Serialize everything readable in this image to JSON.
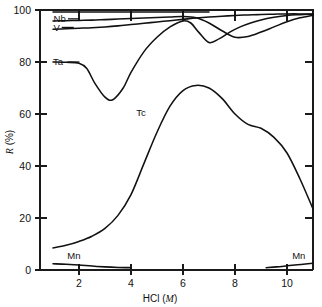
{
  "chart_data": {
    "type": "line",
    "title": "",
    "xlabel": "HCl (M)",
    "ylabel": "R (%)",
    "xlim": [
      0.5,
      11.0
    ],
    "ylim": [
      0,
      100
    ],
    "xticks": [
      2,
      4,
      6,
      8,
      10
    ],
    "xticklabels": [
      "2",
      "4",
      "6",
      "8",
      "10"
    ],
    "yticks": [
      0,
      20,
      40,
      60,
      80,
      100
    ],
    "yticklabels": [
      "0",
      "20",
      "40",
      "60",
      "80",
      "100"
    ],
    "grid": false,
    "legend": "inline-labels",
    "series": [
      {
        "name": "Nb",
        "label": "Nb",
        "x": [
          1.0,
          1.5,
          2.0,
          2.5,
          3.0,
          3.5,
          4.0,
          4.5,
          5.0,
          5.5,
          6.0,
          6.5,
          7.0,
          7.5,
          8.0,
          8.5,
          9.0,
          9.5,
          10.0,
          10.5,
          11.0
        ],
        "values": [
          95.8,
          95.9,
          96.0,
          96.1,
          96.3,
          96.5,
          96.7,
          96.9,
          97.1,
          97.3,
          97.5,
          97.0,
          95.0,
          92.0,
          89.5,
          89.8,
          91.5,
          93.5,
          95.5,
          97.0,
          98.0
        ]
      },
      {
        "name": "V",
        "label": "V",
        "x": [
          1.0,
          1.5,
          2.0,
          2.5,
          3.0,
          3.5,
          4.0,
          4.5,
          5.0,
          5.5,
          6.0,
          6.5,
          7.0,
          7.5,
          8.0,
          8.5,
          9.0,
          9.5,
          10.0,
          10.5,
          11.0
        ],
        "values": [
          92.6,
          92.8,
          93.0,
          93.2,
          93.5,
          93.9,
          94.4,
          94.9,
          95.4,
          95.9,
          96.4,
          96.9,
          97.3,
          97.6,
          97.9,
          98.1,
          98.3,
          98.4,
          98.5,
          98.5,
          98.5
        ]
      },
      {
        "name": "Ta",
        "label": "Ta",
        "x": [
          1.0,
          1.5,
          2.0,
          2.3,
          2.6,
          3.0,
          3.3,
          3.7,
          4.0,
          4.5,
          5.0,
          5.5,
          6.0,
          6.3,
          6.6,
          7.0,
          7.4,
          7.8,
          8.2,
          8.6,
          9.0,
          9.5,
          10.0,
          10.5,
          11.0
        ],
        "values": [
          80.0,
          79.9,
          79.5,
          77.5,
          72.0,
          66.5,
          65.5,
          70.0,
          76.0,
          84.0,
          89.5,
          93.5,
          95.8,
          95.0,
          91.5,
          87.5,
          89.0,
          91.5,
          93.5,
          95.0,
          96.2,
          97.2,
          97.9,
          98.2,
          98.4
        ]
      },
      {
        "name": "Tc",
        "label": "Tc",
        "x": [
          1.0,
          1.5,
          2.0,
          2.5,
          3.0,
          3.5,
          4.0,
          4.5,
          5.0,
          5.5,
          6.0,
          6.5,
          7.0,
          7.5,
          8.0,
          8.5,
          9.0,
          9.5,
          10.0,
          10.5,
          11.0
        ],
        "values": [
          8.5,
          9.5,
          11.0,
          13.0,
          16.0,
          21.0,
          29.0,
          41.0,
          53.0,
          63.0,
          69.0,
          71.0,
          70.0,
          66.0,
          60.0,
          56.0,
          54.5,
          51.0,
          45.0,
          35.0,
          23.5
        ]
      },
      {
        "name": "Mn-left",
        "label": "Mn",
        "x": [
          1.0,
          1.5,
          2.0,
          2.5,
          3.0,
          3.5,
          4.0
        ],
        "values": [
          2.4,
          2.2,
          1.9,
          1.5,
          1.2,
          1.0,
          0.9
        ]
      },
      {
        "name": "Mn-right",
        "label": "Mn",
        "x": [
          9.2,
          9.6,
          10.0,
          10.4,
          10.8,
          11.0
        ],
        "values": [
          0.9,
          1.2,
          1.6,
          2.0,
          2.4,
          2.6
        ]
      }
    ],
    "annotations": [
      {
        "text": "Nb",
        "x": 1.02,
        "y": 96.6,
        "leader": true
      },
      {
        "text": "V",
        "x": 1.02,
        "y": 93.3,
        "leader": true
      },
      {
        "text": "Ta",
        "x": 1.0,
        "y": 80.0,
        "leader": true
      },
      {
        "text": "Tc",
        "x": 4.2,
        "y": 60.5,
        "leader": false
      },
      {
        "text": "Mn",
        "x": 1.55,
        "y": 5.4,
        "leader": false
      },
      {
        "text": "Mn",
        "x": 10.2,
        "y": 5.4,
        "leader": false
      }
    ],
    "top_baseline": {
      "description": "flat reference line near 99% spanning x 1 to 7",
      "x": [
        1.0,
        7.0
      ],
      "value": 99.2
    },
    "colors": {
      "curve": "#111111",
      "axis": "#1a1a1a",
      "background": "#ffffff"
    }
  }
}
